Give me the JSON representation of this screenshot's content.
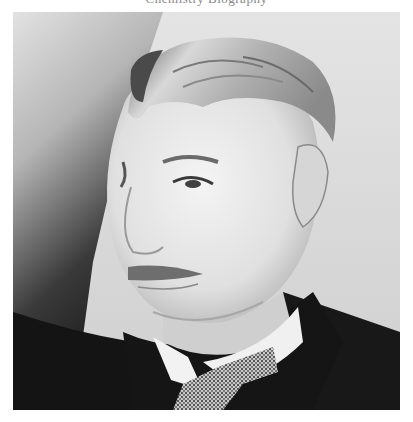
{
  "caption": {
    "text": "Chemistry Biography",
    "note_clipped": true
  },
  "photo": {
    "alt": "Black-and-white vintage portrait of an older man with white hair and mustache, wearing a white wing collar, checked bow tie and dark coat",
    "style": "grayscale",
    "colors": {
      "background_light": "#d8d8d8",
      "background_dark": "#1e1e1e",
      "skin": "#e6e6e6",
      "hair": "#c4c4c4",
      "coat": "#161616",
      "collar": "#f2f2f2",
      "tie": "#9a9a9a"
    }
  }
}
